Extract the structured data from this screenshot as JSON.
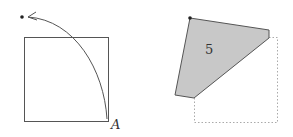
{
  "left_figure": {
    "description": "Square with corner A rotated along an arc to a point above",
    "corner_label": "A",
    "stroke_color": "#555555",
    "dot_color": "#222222"
  },
  "right_figure": {
    "description": "Folded square: shaded pentagon region with dotted outline of original square",
    "region_label": "5",
    "fill_color": "#c8c8c8",
    "stroke_color": "#555555",
    "dotted_color": "#aaaaaa",
    "dot_color": "#222222"
  }
}
